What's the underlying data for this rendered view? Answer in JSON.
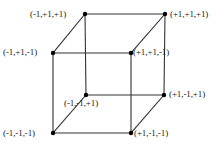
{
  "diagram": {
    "kind": "cube-vertex-coordinate-diagram",
    "stroke_color": "#333333",
    "vertex_color": "#000000",
    "text_color": "#1a1a1a",
    "background_color": "#ffffff"
  },
  "vertices": [
    {
      "id": "back-top-left",
      "label": "(-1,+1,+1)",
      "x": 85,
      "y": 14,
      "coords": [
        -1,
        1,
        1
      ]
    },
    {
      "id": "back-top-right",
      "label": "(+1,+1,+1)",
      "x": 165,
      "y": 14,
      "coords": [
        1,
        1,
        1
      ]
    },
    {
      "id": "front-top-left",
      "label": "(-1,+1,-1)",
      "x": 53,
      "y": 53,
      "coords": [
        -1,
        1,
        -1
      ]
    },
    {
      "id": "front-top-right",
      "label": "(+1,+1,-1)",
      "x": 131,
      "y": 53,
      "coords": [
        1,
        1,
        -1
      ]
    },
    {
      "id": "back-bottom-left",
      "label": "(-1,-1,+1)",
      "x": 86,
      "y": 95,
      "coords": [
        -1,
        -1,
        1
      ]
    },
    {
      "id": "back-bottom-right",
      "label": "(+1,-1,+1)",
      "x": 164,
      "y": 95,
      "coords": [
        1,
        -1,
        1
      ]
    },
    {
      "id": "front-bottom-left",
      "label": "(-1,-1,-1)",
      "x": 53,
      "y": 133,
      "coords": [
        -1,
        -1,
        -1
      ]
    },
    {
      "id": "front-bottom-right",
      "label": "(+1,-1,-1)",
      "x": 131,
      "y": 133,
      "coords": [
        1,
        -1,
        -1
      ]
    }
  ],
  "edges": [
    {
      "from": "back-top-left",
      "to": "back-top-right"
    },
    {
      "from": "back-top-left",
      "to": "front-top-left"
    },
    {
      "from": "back-top-left",
      "to": "back-bottom-left"
    },
    {
      "from": "back-top-right",
      "to": "front-top-right"
    },
    {
      "from": "back-top-right",
      "to": "back-bottom-right"
    },
    {
      "from": "front-top-left",
      "to": "front-top-right"
    },
    {
      "from": "front-top-left",
      "to": "front-bottom-left"
    },
    {
      "from": "front-top-right",
      "to": "front-bottom-right"
    },
    {
      "from": "back-bottom-left",
      "to": "back-bottom-right"
    },
    {
      "from": "back-bottom-left",
      "to": "front-bottom-left"
    },
    {
      "from": "back-bottom-right",
      "to": "front-bottom-right"
    },
    {
      "from": "front-bottom-left",
      "to": "front-bottom-right"
    }
  ]
}
